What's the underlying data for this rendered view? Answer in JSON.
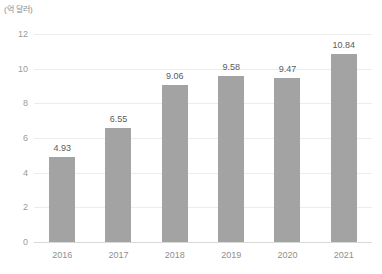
{
  "unit_label": "(억 달러)",
  "chart_data": {
    "type": "bar",
    "title": "",
    "subtitle": "",
    "xlabel": "",
    "ylabel": "",
    "unit": "(억 달러)",
    "categories": [
      "2016",
      "2017",
      "2018",
      "2019",
      "2020",
      "2021"
    ],
    "values": [
      4.93,
      6.55,
      9.06,
      9.58,
      9.47,
      10.84
    ],
    "value_labels": [
      "4.93",
      "6.55",
      "9.06",
      "9.58",
      "9.47",
      "10.84"
    ],
    "ylim": [
      0,
      12
    ],
    "yticks": [
      0,
      2,
      4,
      6,
      8,
      10,
      12
    ],
    "ytick_labels": [
      "0",
      "2",
      "4",
      "6",
      "8",
      "10",
      "12"
    ],
    "grid": true,
    "grid_axis": "y",
    "legend": false,
    "legend_position": "none",
    "bar_color": "#a3a3a3",
    "grid_color": "#ededed",
    "axis_color": "#d9d9d9",
    "label_color": "#5c5c5c",
    "tick_color": "#9b9b9b",
    "background": "#ffffff"
  }
}
